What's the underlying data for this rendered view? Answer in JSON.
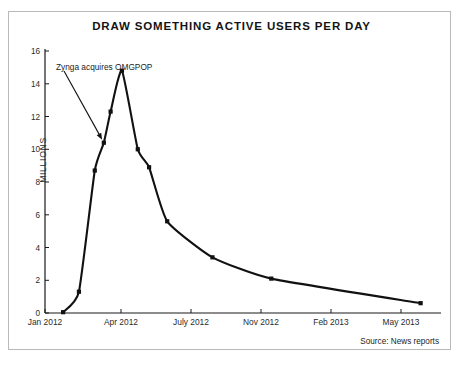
{
  "figure": {
    "title": "DRAW SOMETHING ACTIVE USERS PER DAY",
    "source_note": "Source: News reports",
    "frame_color": "#b9b9b9",
    "line_color": "#111111",
    "background": "#ffffff"
  },
  "chart_data": {
    "type": "line",
    "title": "DRAW SOMETHING ACTIVE USERS PER DAY",
    "xlabel": "",
    "ylabel": "MILLIONS",
    "grid": false,
    "legend": "none",
    "ylim": [
      0,
      16
    ],
    "y_ticks": [
      0,
      2,
      4,
      6,
      8,
      10,
      12,
      14,
      16
    ],
    "y_tick_labels": [
      "0",
      "2",
      "4",
      "6",
      "8",
      "10",
      "12",
      "14",
      "16"
    ],
    "x_tick_labels": [
      "Jan 2012",
      "Apr 2012",
      "July 2012",
      "Nov 2012",
      "Feb 2013",
      "May 2013"
    ],
    "x_tick_months": [
      0,
      3,
      6,
      10,
      13,
      16
    ],
    "xlim_months": [
      0,
      17.5
    ],
    "series": [
      {
        "name": "Draw Something active users per day",
        "units": "millions",
        "points": [
          {
            "month": 0.8,
            "x_label": "late Jan 2012",
            "value": 0.05
          },
          {
            "month": 1.5,
            "x_label": "mid Feb 2012",
            "value": 1.3
          },
          {
            "month": 2.2,
            "x_label": "early Mar 2012",
            "value": 8.7
          },
          {
            "month": 2.6,
            "x_label": "mid Mar 2012",
            "value": 10.4
          },
          {
            "month": 2.9,
            "x_label": "late Mar 2012",
            "value": 12.3
          },
          {
            "month": 3.4,
            "x_label": "early Apr 2012",
            "value": 14.8
          },
          {
            "month": 4.1,
            "x_label": "mid Apr 2012",
            "value": 10.0
          },
          {
            "month": 4.6,
            "x_label": "late Apr 2012",
            "value": 8.9
          },
          {
            "month": 5.4,
            "x_label": "May 2012",
            "value": 5.6
          },
          {
            "month": 7.4,
            "x_label": "Aug 2012",
            "value": 3.4
          },
          {
            "month": 10.0,
            "x_label": "Nov 2012",
            "value": 2.1
          },
          {
            "month": 16.6,
            "x_label": "May 2013",
            "value": 0.6
          }
        ]
      }
    ],
    "annotations": [
      {
        "text": "Zynga acquires OMGPOP",
        "target_month": 2.6,
        "target_value": 10.4,
        "arrow": true
      }
    ],
    "peak": {
      "month": 3.4,
      "value": 14.8
    }
  },
  "axes": {
    "y_title": "MILLIONS"
  }
}
